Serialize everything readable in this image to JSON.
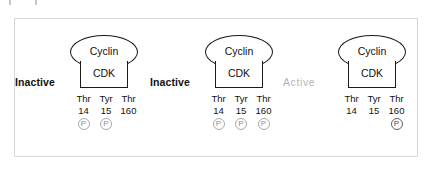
{
  "figure": {
    "frame_color": "#d7d7d7",
    "background": "#ffffff",
    "artifacts": [
      "scan-mark-left",
      "scan-mark-right"
    ]
  },
  "labels": {
    "cyclin": "Cyclin",
    "cdk": "CDK",
    "phosphate": "P"
  },
  "residue_headers": {
    "thr14_name": "Thr",
    "thr14_num": "14",
    "tyr15_name": "Tyr",
    "tyr15_num": "15",
    "thr160_name": "Thr",
    "thr160_num": "160"
  },
  "colors": {
    "inactive_text": "#111111",
    "active_text": "#b4b4b4",
    "outline": "#1a1a1a",
    "phosphate_light": "#8f8f8f",
    "phosphate_dark": "#4a4a4a"
  },
  "complexes": [
    {
      "state": "Inactive",
      "state_muted": false,
      "cyclin": "Cyclin",
      "cdk": "CDK",
      "residues": [
        {
          "name": "Thr",
          "number": "14",
          "phosphorylated": true,
          "phos_label": "P",
          "phos_style": "light"
        },
        {
          "name": "Tyr",
          "number": "15",
          "phosphorylated": true,
          "phos_label": "P",
          "phos_style": "light"
        },
        {
          "name": "Thr",
          "number": "160",
          "phosphorylated": false,
          "phos_label": "P",
          "phos_style": "light"
        }
      ]
    },
    {
      "state": "Inactive",
      "state_muted": false,
      "cyclin": "Cyclin",
      "cdk": "CDK",
      "residues": [
        {
          "name": "Thr",
          "number": "14",
          "phosphorylated": true,
          "phos_label": "P",
          "phos_style": "light"
        },
        {
          "name": "Tyr",
          "number": "15",
          "phosphorylated": true,
          "phos_label": "P",
          "phos_style": "light"
        },
        {
          "name": "Thr",
          "number": "160",
          "phosphorylated": true,
          "phos_label": "P",
          "phos_style": "light"
        }
      ]
    },
    {
      "state": "Active",
      "state_muted": true,
      "cyclin": "Cyclin",
      "cdk": "CDK",
      "residues": [
        {
          "name": "Thr",
          "number": "14",
          "phosphorylated": false,
          "phos_label": "P",
          "phos_style": "dark"
        },
        {
          "name": "Tyr",
          "number": "15",
          "phosphorylated": false,
          "phos_label": "P",
          "phos_style": "dark"
        },
        {
          "name": "Thr",
          "number": "160",
          "phosphorylated": true,
          "phos_label": "P",
          "phos_style": "dark"
        }
      ]
    }
  ]
}
